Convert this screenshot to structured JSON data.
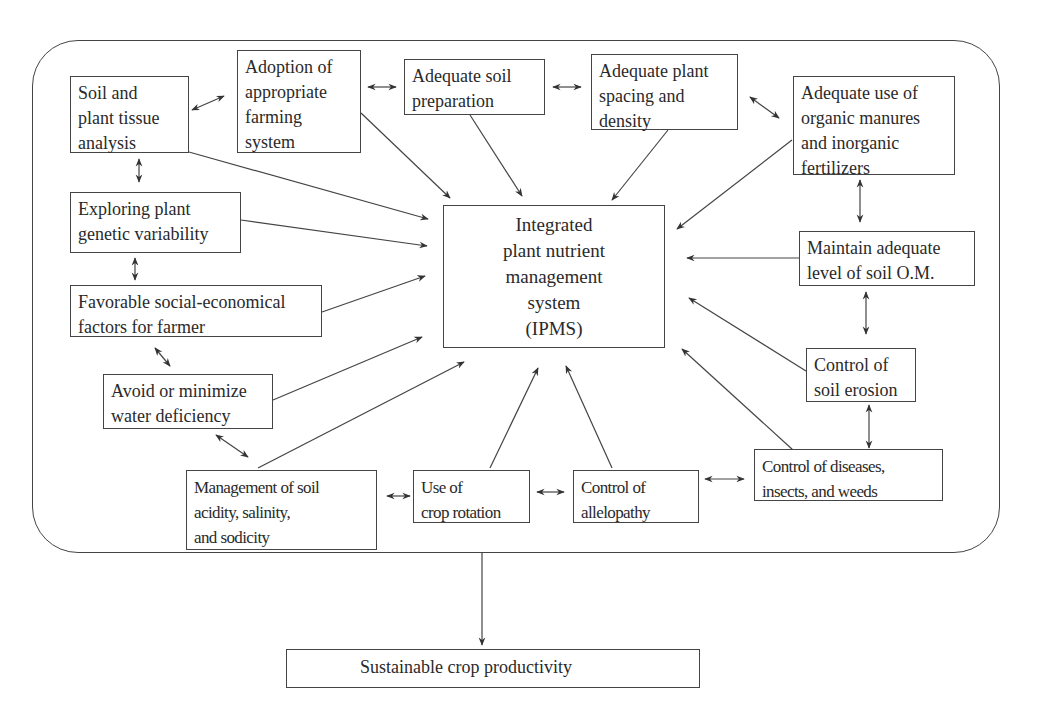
{
  "diagram": {
    "type": "concept-map",
    "center": {
      "id": "ipms",
      "label": "Integrated\nplant nutrient\nmanagement\nsystem\n(IPMS)"
    },
    "factors": [
      {
        "id": "soil_tissue",
        "label": "Soil and\nplant tissue\nanalysis"
      },
      {
        "id": "farming_system",
        "label": "Adoption of\nappropriate\nfarming\nsystem"
      },
      {
        "id": "soil_prep",
        "label": "Adequate soil\npreparation"
      },
      {
        "id": "spacing",
        "label": "Adequate plant\nspacing and\ndensity"
      },
      {
        "id": "manures",
        "label": "Adequate use of\norganic manures\nand inorganic\nfertilizers"
      },
      {
        "id": "genetic",
        "label": "Exploring plant\ngenetic variability"
      },
      {
        "id": "socio",
        "label": "Favorable social-economical\nfactors for farmer"
      },
      {
        "id": "water",
        "label": "Avoid or minimize\nwater deficiency"
      },
      {
        "id": "acidity",
        "label": "Management of soil\nacidity, salinity,\nand sodicity"
      },
      {
        "id": "rotation",
        "label": "Use of\ncrop rotation"
      },
      {
        "id": "allelopathy",
        "label": "Control of\nallelopathy"
      },
      {
        "id": "pests",
        "label": "Control of diseases,\ninsects, and weeds"
      },
      {
        "id": "erosion",
        "label": "Control of\nsoil erosion"
      },
      {
        "id": "om",
        "label": "Maintain adequate\nlevel of soil O.M."
      }
    ],
    "result": {
      "id": "sustainable",
      "label": "Sustainable crop productivity"
    },
    "edges": [
      {
        "from": "soil_tissue",
        "to": "ipms",
        "type": "directed"
      },
      {
        "from": "farming_system",
        "to": "ipms",
        "type": "directed"
      },
      {
        "from": "soil_prep",
        "to": "ipms",
        "type": "directed"
      },
      {
        "from": "spacing",
        "to": "ipms",
        "type": "directed"
      },
      {
        "from": "manures",
        "to": "ipms",
        "type": "directed"
      },
      {
        "from": "genetic",
        "to": "ipms",
        "type": "directed"
      },
      {
        "from": "socio",
        "to": "ipms",
        "type": "directed"
      },
      {
        "from": "water",
        "to": "ipms",
        "type": "directed"
      },
      {
        "from": "acidity",
        "to": "ipms",
        "type": "directed"
      },
      {
        "from": "rotation",
        "to": "ipms",
        "type": "directed"
      },
      {
        "from": "allelopathy",
        "to": "ipms",
        "type": "directed"
      },
      {
        "from": "pests",
        "to": "ipms",
        "type": "directed"
      },
      {
        "from": "erosion",
        "to": "ipms",
        "type": "directed"
      },
      {
        "from": "om",
        "to": "ipms",
        "type": "directed"
      },
      {
        "from": "soil_tissue",
        "to": "farming_system",
        "type": "bidirectional"
      },
      {
        "from": "farming_system",
        "to": "soil_prep",
        "type": "bidirectional"
      },
      {
        "from": "soil_prep",
        "to": "spacing",
        "type": "bidirectional"
      },
      {
        "from": "spacing",
        "to": "manures",
        "type": "bidirectional"
      },
      {
        "from": "manures",
        "to": "om",
        "type": "bidirectional"
      },
      {
        "from": "om",
        "to": "erosion",
        "type": "bidirectional"
      },
      {
        "from": "erosion",
        "to": "pests",
        "type": "bidirectional"
      },
      {
        "from": "pests",
        "to": "allelopathy",
        "type": "bidirectional"
      },
      {
        "from": "allelopathy",
        "to": "rotation",
        "type": "bidirectional"
      },
      {
        "from": "rotation",
        "to": "acidity",
        "type": "bidirectional"
      },
      {
        "from": "acidity",
        "to": "water",
        "type": "bidirectional"
      },
      {
        "from": "water",
        "to": "socio",
        "type": "bidirectional"
      },
      {
        "from": "socio",
        "to": "genetic",
        "type": "bidirectional"
      },
      {
        "from": "genetic",
        "to": "soil_tissue",
        "type": "bidirectional"
      },
      {
        "from": "system_frame",
        "to": "sustainable",
        "type": "directed"
      }
    ]
  },
  "colors": {
    "line": "#444444",
    "text": "#2a2a2a",
    "background": "#ffffff"
  }
}
